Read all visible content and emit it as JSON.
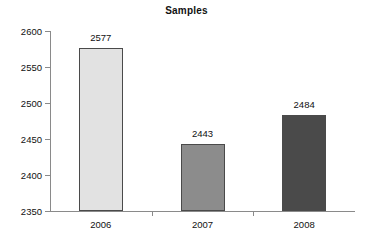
{
  "chart_data": {
    "type": "bar",
    "title": "Samples",
    "xlabel": "",
    "ylabel": "",
    "categories": [
      "2006",
      "2007",
      "2008"
    ],
    "values": [
      2577,
      2443,
      2484
    ],
    "value_labels": [
      "2577",
      "2443",
      "2484"
    ],
    "ylim": [
      2350,
      2600
    ],
    "yticks": [
      2350,
      2400,
      2450,
      2500,
      2550,
      2600
    ],
    "ytick_labels": [
      "2350",
      "2400",
      "2450",
      "2500",
      "2550",
      "2600"
    ],
    "grid": false,
    "legend": false,
    "bar_colors": [
      "#e2e2e2",
      "#8c8c8c",
      "#4a4a4a"
    ],
    "bar_edge_color": "#4a4a4a",
    "axis_color": "#8a8a8a",
    "background": "#ffffff",
    "text_color": "#111111"
  }
}
